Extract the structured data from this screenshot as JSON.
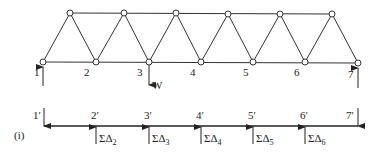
{
  "truss": {
    "bottom_nodes": [
      {
        "id": "1",
        "label": "1",
        "x": 43,
        "y": 62
      },
      {
        "id": "2",
        "label": "2",
        "x": 96,
        "y": 62
      },
      {
        "id": "3",
        "label": "3",
        "x": 149,
        "y": 62
      },
      {
        "id": "4",
        "label": "4",
        "x": 201,
        "y": 62
      },
      {
        "id": "5",
        "label": "5",
        "x": 253,
        "y": 62
      },
      {
        "id": "6",
        "label": "6",
        "x": 305,
        "y": 62
      },
      {
        "id": "7",
        "label": "7",
        "x": 358,
        "y": 63
      }
    ],
    "top_nodes": [
      {
        "x": 70,
        "y": 13
      },
      {
        "x": 124,
        "y": 13
      },
      {
        "x": 176,
        "y": 13
      },
      {
        "x": 228,
        "y": 14
      },
      {
        "x": 280,
        "y": 14
      },
      {
        "x": 332,
        "y": 14
      }
    ],
    "load_label": "W"
  },
  "influence": {
    "part_label": "(i)",
    "nodes": [
      {
        "label": "1′",
        "x": 44
      },
      {
        "label": "2′",
        "x": 96,
        "force": "ΣΔ",
        "sub": "2"
      },
      {
        "label": "3′",
        "x": 149,
        "force": "ΣΔ",
        "sub": "3"
      },
      {
        "label": "4′",
        "x": 201,
        "force": "ΣΔ",
        "sub": "4"
      },
      {
        "label": "5′",
        "x": 253,
        "force": "ΣΔ",
        "sub": "5"
      },
      {
        "label": "6′",
        "x": 305,
        "force": "ΣΔ",
        "sub": "6"
      },
      {
        "label": "7′",
        "x": 358
      }
    ]
  },
  "colors": {
    "line": "#333333",
    "background": "#ffffff"
  }
}
